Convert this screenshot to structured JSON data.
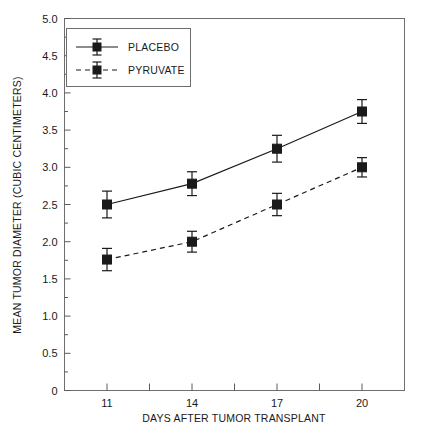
{
  "chart_data": {
    "type": "line",
    "title": "",
    "xlabel": "DAYS AFTER TUMOR TRANSPLANT",
    "ylabel": "MEAN TUMOR DIAMETER (CUBIC CENTIMETERS)",
    "x": [
      11,
      14,
      17,
      20
    ],
    "xtick_labels": [
      "11",
      "14",
      "17",
      "20"
    ],
    "xlim": [
      9.5,
      21.5
    ],
    "ylim": [
      0,
      5.0
    ],
    "ytick_labels": [
      "0",
      "0.5",
      "1.0",
      "1.5",
      "2.0",
      "2.5",
      "3.0",
      "3.5",
      "4.0",
      "4.5",
      "5.0"
    ],
    "ytick_values": [
      0,
      0.5,
      1.0,
      1.5,
      2.0,
      2.5,
      3.0,
      3.5,
      4.0,
      4.5,
      5.0
    ],
    "grid": false,
    "legend_position": "upper-left",
    "marker": "filled-square",
    "series": [
      {
        "name": "PLACEBO",
        "linestyle": "solid",
        "color": "#1a1a1a",
        "values": [
          2.5,
          2.78,
          3.25,
          3.75
        ],
        "errors": [
          0.18,
          0.16,
          0.18,
          0.16
        ]
      },
      {
        "name": "PYRUVATE",
        "linestyle": "dashed",
        "color": "#1a1a1a",
        "values": [
          1.76,
          2.0,
          2.5,
          3.0
        ],
        "errors": [
          0.15,
          0.14,
          0.15,
          0.13
        ]
      }
    ]
  },
  "legend": {
    "entries": [
      {
        "label": "PLACEBO"
      },
      {
        "label": "PYRUVATE"
      }
    ]
  },
  "colors": {
    "ink": "#1a1a1a",
    "axis": "#5a5a5a",
    "background": "#ffffff"
  }
}
